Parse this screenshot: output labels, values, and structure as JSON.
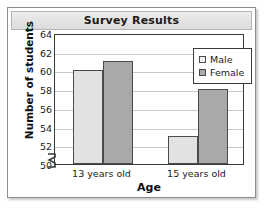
{
  "chart_data": {
    "type": "bar",
    "title": "Survey Results",
    "xlabel": "Age",
    "ylabel": "Number of students",
    "categories": [
      "13 years old",
      "15 years old"
    ],
    "series": [
      {
        "name": "Male",
        "values": [
          60,
          53
        ],
        "color": "#e2e2e2"
      },
      {
        "name": "Female",
        "values": [
          61,
          58
        ],
        "color": "#a9a9a9"
      }
    ],
    "ylim": [
      50,
      64
    ],
    "ytick_labels": [
      "64",
      "62",
      "60",
      "58",
      "56",
      "54",
      "52",
      "50"
    ],
    "ytick_values": [
      64,
      62,
      60,
      58,
      56,
      54,
      52,
      50
    ],
    "grid": true,
    "axis_break": true,
    "legend_position": "top-right",
    "legend_entries": [
      "Male",
      "Female"
    ]
  },
  "legend": {
    "items": [
      {
        "label": "Male",
        "swatch": "light-gray-square"
      },
      {
        "label": "Female",
        "swatch": "medium-gray-square"
      }
    ]
  },
  "icons": {
    "axis_break": "axis-break-zigzag"
  }
}
